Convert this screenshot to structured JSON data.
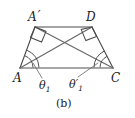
{
  "figure": {
    "caption": "(b)",
    "stroke_color": "#4a4a4a",
    "base_color": "#8a8a8a",
    "text_color": "#1a1a1a",
    "background": "#ffffff",
    "vertices": [
      {
        "id": "A",
        "label": "A",
        "prime": "",
        "x": 20,
        "y": 68
      },
      {
        "id": "C",
        "label": "C",
        "prime": "",
        "x": 113,
        "y": 68
      },
      {
        "id": "Ap",
        "label": "A",
        "prime": "′",
        "x": 35,
        "y": 27
      },
      {
        "id": "D",
        "label": "D",
        "prime": "",
        "x": 92,
        "y": 27
      }
    ],
    "segments": [
      {
        "name": "base-AC",
        "from": "A",
        "to": "C"
      },
      {
        "name": "side-A-Aprime",
        "from": "A",
        "to": "Ap"
      },
      {
        "name": "side-Aprime-D",
        "from": "Ap",
        "to": "D"
      },
      {
        "name": "side-D-C",
        "from": "D",
        "to": "C"
      },
      {
        "name": "diagonal-A-D",
        "from": "A",
        "to": "D"
      },
      {
        "name": "diagonal-C-Aprime",
        "from": "C",
        "to": "Ap"
      }
    ],
    "right_angles": [
      {
        "at": "Ap",
        "name": "right-angle-marker-a-prime"
      },
      {
        "at": "D",
        "name": "right-angle-marker-d"
      }
    ],
    "angle_labels": [
      {
        "name": "angle-theta-1",
        "symbol": "θ",
        "prime": "",
        "subscript": "1",
        "at_vertex": "A",
        "arcs": 2
      },
      {
        "name": "angle-theta-1-prime",
        "symbol": "θ",
        "prime": "′",
        "subscript": "1",
        "at_vertex": "C",
        "arcs": 2
      }
    ],
    "leaders": [
      {
        "name": "leader-theta-1",
        "x1": 33,
        "y1": 63,
        "x2": 42,
        "y2": 78
      },
      {
        "name": "leader-theta-1-prime",
        "x1": 98,
        "y1": 63,
        "x2": 78,
        "y2": 77
      }
    ]
  }
}
